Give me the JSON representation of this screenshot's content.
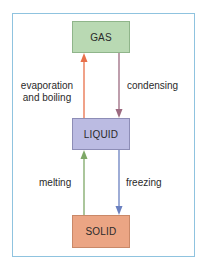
{
  "diagram": {
    "states": {
      "gas": {
        "label": "GAS",
        "fill": "#b9d9b3"
      },
      "liquid": {
        "label": "LIQUID",
        "fill": "#bbbbe2"
      },
      "solid": {
        "label": "SOLID",
        "fill": "#eba584"
      }
    },
    "transitions": {
      "evaporation": {
        "line1": "evaporation",
        "line2": "and boiling",
        "from": "LIQUID",
        "to": "GAS",
        "color": "#e8704a"
      },
      "condensing": {
        "label": "condensing",
        "from": "GAS",
        "to": "LIQUID",
        "color": "#9c6a80"
      },
      "melting": {
        "label": "melting",
        "from": "SOLID",
        "to": "LIQUID",
        "color": "#7ea866"
      },
      "freezing": {
        "label": "freezing",
        "from": "LIQUID",
        "to": "SOLID",
        "color": "#6a80c0"
      }
    },
    "frame_color": "#8fc3df"
  }
}
